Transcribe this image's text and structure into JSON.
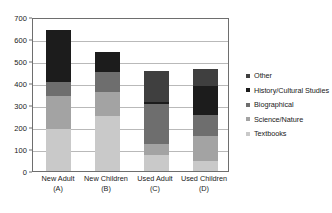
{
  "chart_data": {
    "type": "bar",
    "subtype": "stacked-vertical",
    "title": "",
    "subtitle": "",
    "xlabel": "",
    "ylabel": "",
    "ylim": [
      0,
      700
    ],
    "ytick_values": [
      0,
      100,
      200,
      300,
      400,
      500,
      600,
      700
    ],
    "ytick_labels": [
      "0",
      "100",
      "200",
      "300",
      "400",
      "500",
      "600",
      "700"
    ],
    "grid": true,
    "grid_axis": "y",
    "legend_position": "right",
    "legend_order_top_to_bottom": [
      "Other",
      "History/Cultural Studies",
      "Biographical",
      "Science/Nature",
      "Textbooks"
    ],
    "categories": [
      "New Adult\n(A)",
      "New Children\n(B)",
      "Used Adult\n(C)",
      "Used Children\n(D)"
    ],
    "category_labels": [
      {
        "line1": "New Adult",
        "line2": "(A)"
      },
      {
        "line1": "New Children",
        "line2": "(B)"
      },
      {
        "line1": "Used Adult",
        "line2": "(C)"
      },
      {
        "line1": "Used Children",
        "line2": "(D)"
      }
    ],
    "series": [
      {
        "name": "Textbooks",
        "color": "#c9c9c9",
        "values": [
          195,
          255,
          75,
          45
        ]
      },
      {
        "name": "Science/Nature",
        "color": "#a3a3a3",
        "values": [
          150,
          110,
          50,
          115
        ]
      },
      {
        "name": "Biographical",
        "color": "#6e6e6e",
        "values": [
          65,
          90,
          185,
          100
        ]
      },
      {
        "name": "History/Cultural Studies",
        "color": "#1c1c1c",
        "values": [
          240,
          93,
          10,
          130
        ]
      },
      {
        "name": "Other",
        "color": "#3f3f3f",
        "values": [
          0,
          0,
          140,
          82
        ]
      }
    ],
    "stack_order_bottom_to_top": [
      "Textbooks",
      "Science/Nature",
      "Biographical",
      "History/Cultural Studies",
      "Other"
    ],
    "totals": [
      650,
      548,
      460,
      472
    ]
  },
  "legend": {
    "items": [
      {
        "label": "Other",
        "color": "#3f3f3f"
      },
      {
        "label": "History/Cultural Studies",
        "color": "#1c1c1c"
      },
      {
        "label": "Biographical",
        "color": "#6e6e6e"
      },
      {
        "label": "Science/Nature",
        "color": "#a3a3a3"
      },
      {
        "label": "Textbooks",
        "color": "#c9c9c9"
      }
    ]
  },
  "axes": {
    "y_labels": [
      "700",
      "600",
      "500",
      "400",
      "300",
      "200",
      "100",
      "0"
    ],
    "x_labels": [
      {
        "line1": "New Adult",
        "line2": "(A)"
      },
      {
        "line1": "New Children",
        "line2": "(B)"
      },
      {
        "line1": "Used Adult",
        "line2": "(C)"
      },
      {
        "line1": "Used Children",
        "line2": "(D)"
      }
    ]
  },
  "style": {
    "plot_border_color": "#6e6e6e",
    "gridline_color": "#b9b9b9",
    "background": "#ffffff",
    "text_color": "#1a1a1a"
  }
}
